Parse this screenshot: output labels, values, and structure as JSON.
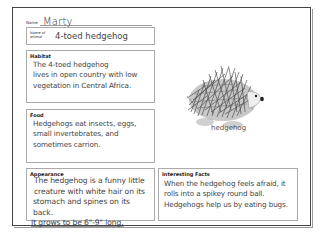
{
  "worksheet": {
    "name_label": "Name",
    "name_value": "Marty",
    "animal_label_line1": "Name of",
    "animal_label_line2": "animal",
    "animal_value": "4-toed hedgehog",
    "sections": {
      "habitat": {
        "title": "Habitat",
        "lines": [
          "The 4-toed hedgehog",
          "lives in open country with low",
          "vegetation in Central Africa."
        ]
      },
      "food": {
        "title": "Food",
        "lines": [
          "Hedgehogs eat insects, eggs,",
          "small invertebrates, and",
          "sometimes carrion."
        ]
      },
      "appearance": {
        "title": "Appearance",
        "lines": [
          "The hedgehog is a funny little",
          "creature with white hair on its",
          "stomach and spines on its back.",
          "It grows to be 6\"-9\" long."
        ]
      },
      "interesting_facts": {
        "title": "Interesting Facts",
        "lines": [
          "When the hedgehog feels afraid, it",
          "rolls into a spikey round ball.",
          "Hedgehogs help us by eating bugs."
        ]
      }
    },
    "picture": {
      "icon": "hedgehog-illustration",
      "caption": "hedgehog"
    }
  }
}
